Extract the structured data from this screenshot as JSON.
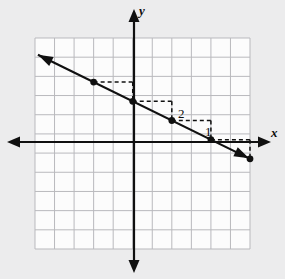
{
  "figure": {
    "kind": "coordinate-plane-line-graph",
    "background_color": "#ececed",
    "plot_background_color": "#fcfcfc",
    "grid_line_color": "#b9b9bd",
    "axis_color": "#101010",
    "line_color": "#101010",
    "point_color": "#101010",
    "dashed_color": "#101010"
  },
  "axes": {
    "x_label": "x",
    "y_label": "y",
    "x_axis_arrows": "both",
    "y_axis_arrows": "both",
    "grid_columns": 11,
    "grid_rows": 11,
    "origin_column_index": 5,
    "origin_row_index": 5
  },
  "annotations": {
    "rise_label": "1",
    "run_label": "2"
  },
  "chart_data": {
    "type": "line",
    "title": "",
    "xlabel": "x",
    "ylabel": "y",
    "grid": true,
    "legend": null,
    "xlim": [
      -5,
      6
    ],
    "ylim": [
      -6,
      5
    ],
    "series": [
      {
        "name": "line",
        "slope": -0.5,
        "y_intercept": 2,
        "equation": "y = -1/2 x + 2",
        "arrows": "both",
        "points": [
          {
            "x": -2,
            "y": 3
          },
          {
            "x": 0,
            "y": 2
          },
          {
            "x": 2,
            "y": 1
          },
          {
            "x": 4,
            "y": 0
          },
          {
            "x": 6,
            "y": -1
          }
        ]
      }
    ],
    "slope_triangle": {
      "run": 2,
      "rise": -1,
      "run_label": "2",
      "rise_label": "1",
      "from": {
        "x": 2,
        "y": 1
      },
      "to": {
        "x": 4,
        "y": 0
      }
    }
  }
}
